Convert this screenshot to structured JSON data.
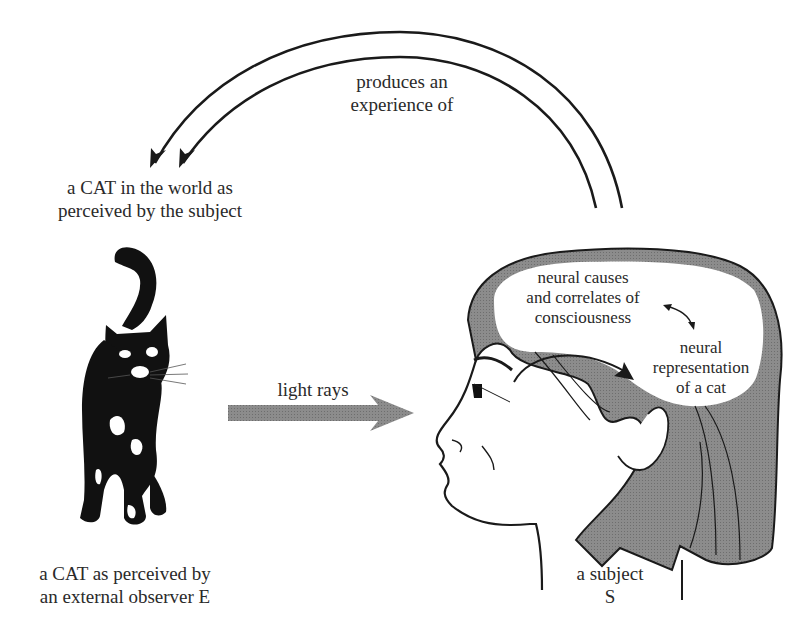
{
  "diagram": {
    "top_arrow_label": [
      "produces an",
      "experience of"
    ],
    "cat_world_label": [
      "a CAT in the world as",
      "perceived by the subject"
    ],
    "light_rays_label": "light rays",
    "cat_external_label": [
      "a CAT as perceived by",
      "an external observer E"
    ],
    "subject_label": [
      "a subject",
      "S"
    ],
    "brain_label_top": [
      "neural causes",
      "and correlates of",
      "consciousness"
    ],
    "brain_label_bottom": [
      "neural",
      "representation",
      "of a cat"
    ],
    "colors": {
      "line": "#1a1a1a",
      "hair": "#7f7f7f",
      "arrow_gray": "#8a8a8a",
      "background": "#ffffff"
    }
  }
}
